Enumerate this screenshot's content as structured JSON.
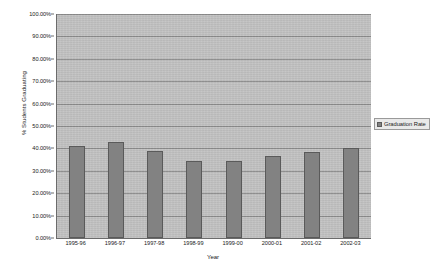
{
  "chart_data": {
    "type": "bar",
    "title": "",
    "xlabel": "Year",
    "ylabel": "% Students Graduating",
    "categories": [
      "1995-96",
      "1996-97",
      "1997-98",
      "1998-99",
      "1999-00",
      "2000-01",
      "2001-02",
      "2002-03"
    ],
    "values": [
      41.0,
      43.0,
      39.0,
      34.5,
      34.5,
      36.5,
      38.5,
      40.0
    ],
    "series": [
      {
        "name": "Graduation Rate",
        "values": [
          41.0,
          43.0,
          39.0,
          34.5,
          34.5,
          36.5,
          38.5,
          40.0
        ]
      }
    ],
    "ylim": [
      0,
      100
    ],
    "ytick_labels": [
      "100.00%",
      "90.00%",
      "80.00%",
      "70.00%",
      "60.00%",
      "50.00%",
      "40.00%",
      "30.00%",
      "20.00%",
      "10.00%",
      "0.00%"
    ],
    "ytick_values": [
      100,
      90,
      80,
      70,
      60,
      50,
      40,
      30,
      20,
      10,
      0
    ],
    "grid": true,
    "legend_position": "right",
    "legend_entries": [
      "Graduation Rate"
    ],
    "colors": {
      "bar_fill": "#828282",
      "bar_border": "#5a5a5a",
      "plot_background": "#c3c3c3",
      "gridline": "#8d8d8d",
      "axis_line": "#6b6b6b",
      "page_background": "#ffffff",
      "text": "#1a1a1a",
      "legend_background": "#e9e9e9",
      "legend_border": "#9a9a9a"
    }
  }
}
